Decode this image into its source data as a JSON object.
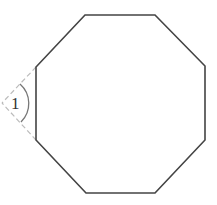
{
  "diagram": {
    "type": "regular-octagon-exterior-angle",
    "shape": "octagon",
    "angle_label": "1",
    "colors": {
      "stroke": "#444444",
      "dashed": "#bbbbbb",
      "arc": "#777777",
      "label": "#333333"
    }
  }
}
